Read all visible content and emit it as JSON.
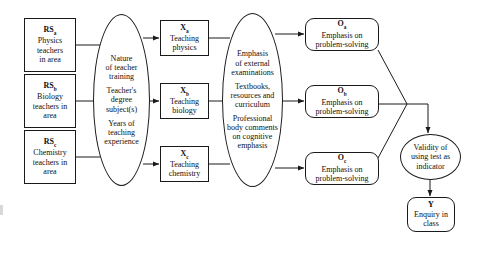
{
  "diagram": {
    "stroke_color": "#1a1a1a",
    "background_color": "#ffffff"
  },
  "inputs": [
    {
      "code": "RS",
      "subscript": "a",
      "lines": [
        "Physics",
        "teachers",
        "in area"
      ]
    },
    {
      "code": "RS",
      "subscript": "b",
      "lines": [
        "Biology",
        "teachers in",
        "area"
      ]
    },
    {
      "code": "RS",
      "subscript": "c",
      "lines": [
        "Chemistry",
        "teachers in",
        "area"
      ]
    }
  ],
  "mediator_one": {
    "groups": [
      [
        "Nature",
        "of teacher",
        "training"
      ],
      [
        "Teacher's",
        "degree",
        "subject(s)"
      ],
      [
        "Years of",
        "teaching",
        "experience"
      ]
    ]
  },
  "treatments": [
    {
      "code": "X",
      "subscript": "a",
      "lines": [
        "Teaching",
        "physics"
      ]
    },
    {
      "code": "X",
      "subscript": "b",
      "lines": [
        "Teaching",
        "biology"
      ]
    },
    {
      "code": "X",
      "subscript": "c",
      "lines": [
        "Teaching",
        "chemistry"
      ]
    }
  ],
  "mediator_two": {
    "groups": [
      [
        "Emphasis",
        "of external",
        "examinations"
      ],
      [
        "Textbooks,",
        "resources and",
        "curriculum"
      ],
      [
        "Professional",
        "body comments",
        "on cognitive",
        "emphasis"
      ]
    ]
  },
  "observations": [
    {
      "code": "O",
      "subscript": "a",
      "lines": [
        "Emphasis on",
        "problem-solving"
      ]
    },
    {
      "code": "O",
      "subscript": "b",
      "lines": [
        "Emphasis on",
        "problem-solving"
      ]
    },
    {
      "code": "O",
      "subscript": "c",
      "lines": [
        "Emphasis on",
        "problem-solving"
      ]
    }
  ],
  "validity": {
    "lines": [
      "Validity of",
      "using test as",
      "indicator"
    ]
  },
  "outcome": {
    "code": "Y",
    "lines": [
      "Enquiry in",
      "class"
    ]
  }
}
